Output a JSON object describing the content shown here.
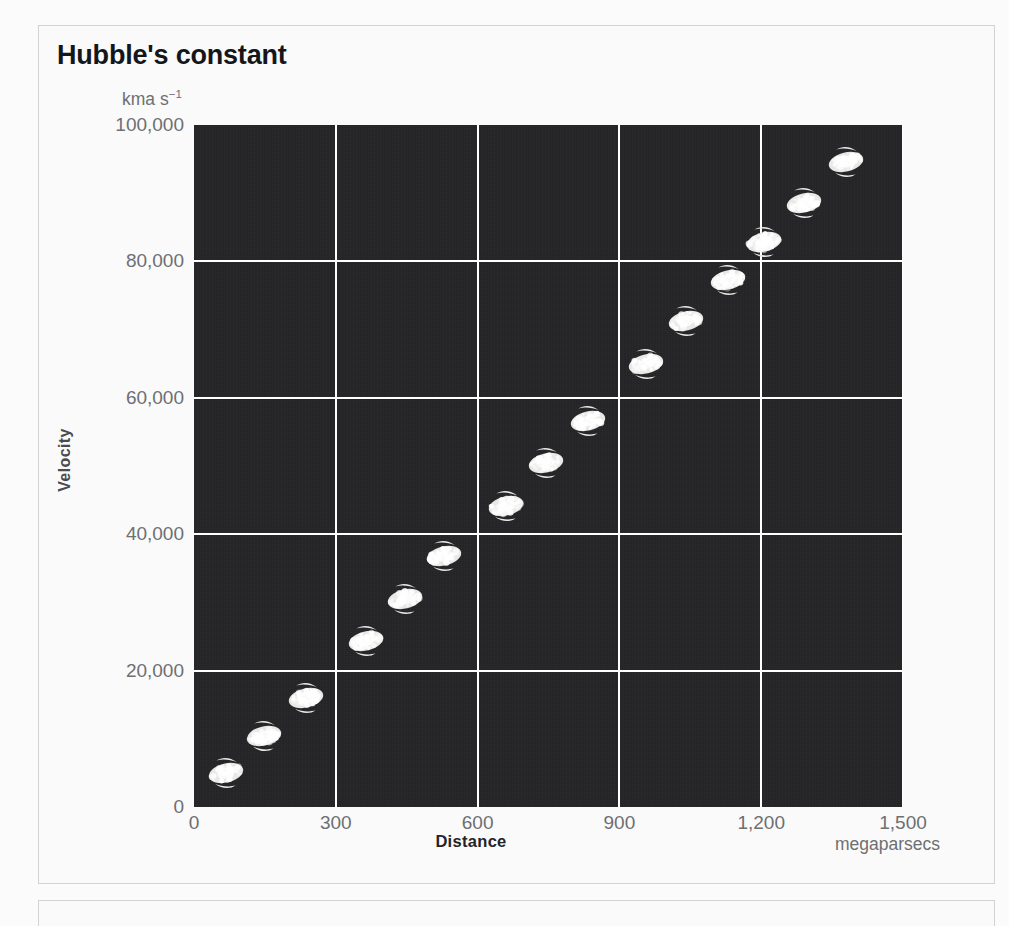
{
  "figure": {
    "title": "Hubble's constant",
    "y_unit": "kma s",
    "y_unit_exponent": "−1",
    "x_unit": "megaparsecs",
    "x_axis_title": "Distance",
    "y_axis_title": "Velocity"
  },
  "colors": {
    "plot_background": "#262628",
    "gridline": "#ffffff",
    "galaxy": "#e8e8e6",
    "tick_text": "#6d6f72",
    "title_text": "#15161a",
    "panel_border": "#d2d2d2",
    "page_background": "#fbfbfb"
  },
  "chart_data": {
    "type": "scatter",
    "title": "Hubble's constant",
    "xlabel": "Distance",
    "ylabel": "Velocity",
    "x_unit": "megaparsecs",
    "y_unit": "kma s−1",
    "xlim": [
      0,
      1500
    ],
    "ylim": [
      0,
      100000
    ],
    "grid": true,
    "legend": null,
    "marker": "galaxy-image",
    "xticks": [
      0,
      300,
      600,
      900,
      1200,
      1500
    ],
    "xtick_labels": [
      "0",
      "300",
      "600",
      "900",
      "1,200",
      "1,500"
    ],
    "yticks": [
      0,
      20000,
      40000,
      60000,
      80000,
      100000
    ],
    "ytick_labels": [
      "0",
      "20,000",
      "40,000",
      "60,000",
      "80,000",
      "100,000"
    ],
    "points": [
      {
        "x": 68,
        "y": 5000
      },
      {
        "x": 148,
        "y": 10400
      },
      {
        "x": 237,
        "y": 16000
      },
      {
        "x": 364,
        "y": 24400
      },
      {
        "x": 446,
        "y": 30500
      },
      {
        "x": 529,
        "y": 36800
      },
      {
        "x": 660,
        "y": 44200
      },
      {
        "x": 745,
        "y": 50400
      },
      {
        "x": 834,
        "y": 56600
      },
      {
        "x": 956,
        "y": 65000
      },
      {
        "x": 1041,
        "y": 71200
      },
      {
        "x": 1130,
        "y": 77200
      },
      {
        "x": 1205,
        "y": 82800
      },
      {
        "x": 1290,
        "y": 88600
      },
      {
        "x": 1380,
        "y": 94600
      }
    ]
  }
}
